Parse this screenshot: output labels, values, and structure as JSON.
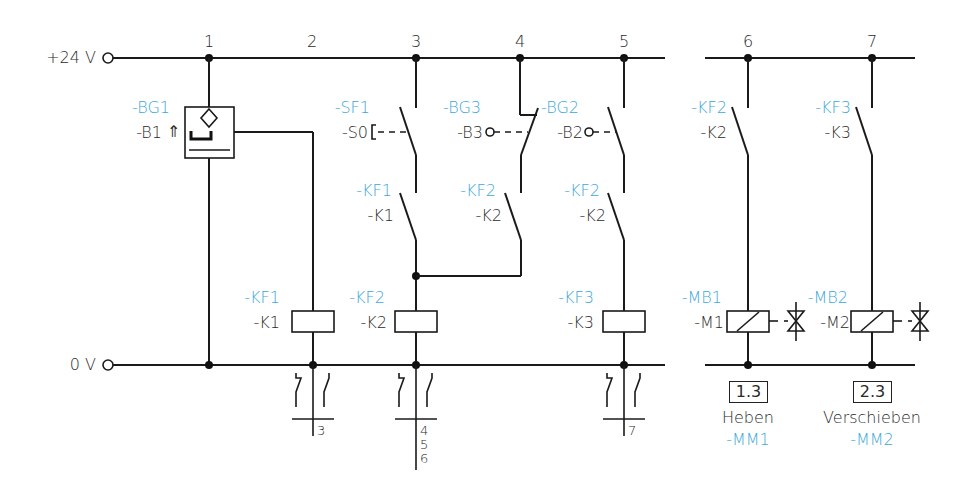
{
  "rails": {
    "top_label": "+24 V",
    "bottom_label": "0 V"
  },
  "paths": [
    "1",
    "2",
    "3",
    "4",
    "5",
    "6",
    "7"
  ],
  "sensors": {
    "bg1": {
      "id": "-BG1",
      "code": "-B1",
      "symbol": "⇑"
    },
    "bg3": {
      "id": "-BG3",
      "code": "-B3"
    },
    "bg2": {
      "id": "-BG2",
      "code": "-B2"
    }
  },
  "switches": {
    "sf1": {
      "id": "-SF1",
      "code": "-S0"
    }
  },
  "contacts": [
    {
      "id": "-KF1",
      "code": "-K1",
      "path": "3"
    },
    {
      "id": "-KF2",
      "code": "-K2",
      "path": "4"
    },
    {
      "id": "-KF2",
      "code": "-K2",
      "path": "5"
    },
    {
      "id": "-KF2",
      "code": "-K2",
      "path": "6"
    },
    {
      "id": "-KF3",
      "code": "-K3",
      "path": "7"
    }
  ],
  "coils": [
    {
      "id": "-KF1",
      "code": "-K1",
      "path": "2"
    },
    {
      "id": "-KF2",
      "code": "-K2",
      "path": "3"
    },
    {
      "id": "-KF3",
      "code": "-K3",
      "path": "5"
    }
  ],
  "valves": [
    {
      "id": "-MB1",
      "code": "-M1",
      "ref": "1.3",
      "name": "Heben",
      "actuator": "-MM1"
    },
    {
      "id": "-MB2",
      "code": "-M2",
      "ref": "2.3",
      "name": "Verschieben",
      "actuator": "-MM2"
    }
  ],
  "contact_tables": [
    {
      "path": "2",
      "refs": "3"
    },
    {
      "path": "3",
      "refs_1": "4",
      "refs_2": "5",
      "refs_3": "6"
    },
    {
      "path": "5",
      "refs": "7"
    }
  ],
  "colors": {
    "id_label": "#3aa8dc",
    "line": "#1a1a1a"
  }
}
